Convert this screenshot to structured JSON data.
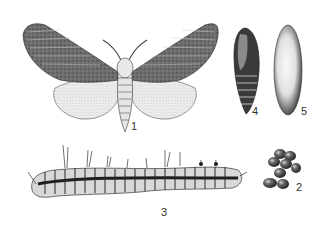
{
  "figure": {
    "kind": "entomological plate - moth life cycle",
    "background": "#ffffff",
    "ink_color": "#2a2a2a",
    "specimens": [
      {
        "id": "adult-moth",
        "label": "1",
        "description": "adult moth, wings spread"
      },
      {
        "id": "eggs",
        "label": "2",
        "description": "egg cluster"
      },
      {
        "id": "caterpillar",
        "label": "3",
        "description": "hairy larva"
      },
      {
        "id": "pupa",
        "label": "4",
        "description": "pupa"
      },
      {
        "id": "cocoon",
        "label": "5",
        "description": "cocoon"
      }
    ]
  }
}
